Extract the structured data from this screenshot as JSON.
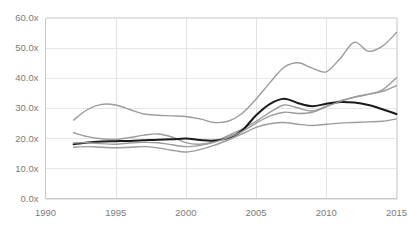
{
  "chart_data": {
    "type": "line",
    "title": "",
    "subtitle": "",
    "xlabel": "",
    "ylabel": "",
    "xlim": [
      1990,
      2015
    ],
    "ylim": [
      0,
      60
    ],
    "grid": true,
    "legend_position": "none",
    "y_tick_labels": [
      "0.0x",
      "10.0x",
      "20.0x",
      "30.0x",
      "40.0x",
      "50.0x",
      "60.0x"
    ],
    "y_ticks": [
      0,
      10,
      20,
      30,
      40,
      50,
      60
    ],
    "x_tick_labels": [
      "1990",
      "1995",
      "2000",
      "2005",
      "2010",
      "2015"
    ],
    "x_ticks": [
      1990,
      1995,
      2000,
      2005,
      2010,
      2015
    ],
    "x": [
      1992,
      1993,
      1994,
      1995,
      1996,
      1997,
      1998,
      1999,
      2000,
      2001,
      2002,
      2003,
      2004,
      2005,
      2006,
      2007,
      2008,
      2009,
      2010,
      2011,
      2012,
      2013,
      2014,
      2015
    ],
    "series": [
      {
        "name": "top-percentile",
        "color": "#9c9c9c",
        "width": 1.4,
        "values": [
          26.0,
          29.5,
          31.2,
          31.0,
          29.5,
          28.0,
          27.6,
          27.4,
          27.2,
          26.4,
          25.2,
          25.6,
          28.2,
          33.0,
          38.5,
          43.5,
          45.0,
          43.2,
          42.0,
          46.5,
          51.8,
          48.8,
          50.5,
          55.0
        ]
      },
      {
        "name": "upper-mid",
        "color": "#9c9c9c",
        "width": 1.4,
        "values": [
          21.8,
          20.5,
          19.8,
          19.6,
          20.2,
          21.0,
          21.4,
          20.4,
          18.5,
          18.0,
          18.8,
          20.8,
          23.0,
          25.6,
          28.6,
          31.0,
          30.0,
          29.0,
          30.6,
          32.4,
          33.6,
          34.5,
          36.0,
          40.0
        ]
      },
      {
        "name": "median-black",
        "color": "#1a1a1a",
        "width": 2.0,
        "values": [
          18.0,
          18.6,
          18.9,
          19.0,
          19.1,
          19.3,
          19.5,
          19.6,
          19.9,
          19.4,
          19.2,
          20.0,
          22.5,
          27.6,
          31.4,
          33.1,
          31.6,
          30.6,
          31.4,
          32.0,
          31.8,
          31.0,
          29.6,
          28.0
        ]
      },
      {
        "name": "lower-mid",
        "color": "#9c9c9c",
        "width": 1.4,
        "values": [
          18.4,
          18.5,
          18.2,
          18.0,
          18.4,
          18.6,
          18.5,
          17.8,
          17.2,
          17.6,
          18.6,
          20.2,
          22.2,
          25.0,
          27.4,
          28.6,
          28.2,
          28.6,
          30.4,
          32.2,
          33.6,
          34.6,
          35.5,
          37.4
        ]
      },
      {
        "name": "bottom-percentile",
        "color": "#9c9c9c",
        "width": 1.4,
        "values": [
          17.0,
          17.2,
          17.0,
          16.8,
          17.0,
          17.2,
          16.8,
          16.0,
          15.4,
          16.2,
          17.6,
          19.4,
          21.4,
          23.6,
          24.8,
          25.2,
          24.6,
          24.2,
          24.6,
          25.0,
          25.2,
          25.4,
          25.6,
          26.4
        ]
      }
    ]
  }
}
